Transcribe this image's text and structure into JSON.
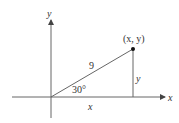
{
  "diagram": {
    "type": "right-triangle-on-axes",
    "axes": {
      "x_label": "x",
      "y_label": "y"
    },
    "point_label": "(x, y)",
    "hypotenuse_label": "9",
    "angle_label": "30°",
    "horizontal_leg_label": "x",
    "vertical_leg_label": "y",
    "colors": {
      "line": "#555555",
      "text": "#333333",
      "point": "#111111"
    }
  }
}
